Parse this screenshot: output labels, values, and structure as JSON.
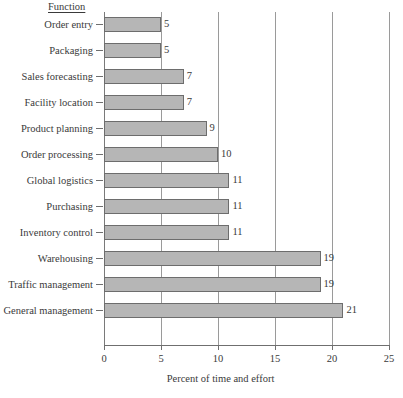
{
  "header": {
    "column_header": "Function"
  },
  "chart_data": {
    "type": "bar",
    "orientation": "horizontal",
    "title": "",
    "xlabel": "Percent of time and effort",
    "ylabel": "Function",
    "categories": [
      "Order entry",
      "Packaging",
      "Sales forecasting",
      "Facility location",
      "Product planning",
      "Order processing",
      "Global logistics",
      "Purchasing",
      "Inventory control",
      "Warehousing",
      "Traffic management",
      "General management"
    ],
    "values": [
      5,
      5,
      7,
      7,
      9,
      10,
      11,
      11,
      11,
      19,
      19,
      21
    ],
    "value_labels": [
      "5",
      "5",
      "7",
      "7",
      "9",
      "10",
      "11",
      "11",
      "11",
      "19",
      "19",
      "21"
    ],
    "xlim": [
      0,
      25
    ],
    "xticks": [
      0,
      5,
      10,
      15,
      20,
      25
    ],
    "xtick_labels": [
      "0",
      "5",
      "10",
      "15",
      "20",
      "25"
    ],
    "grid": true,
    "grid_axis": "x",
    "legend": "none",
    "bar_fill_color": "#b6b6b6",
    "bar_border_color": "#6d6d6d",
    "axis_color": "#6f6f6f",
    "gridline_color": "#9a9a9a",
    "text_color": "#3a3a3a",
    "background_color": "#ffffff"
  }
}
